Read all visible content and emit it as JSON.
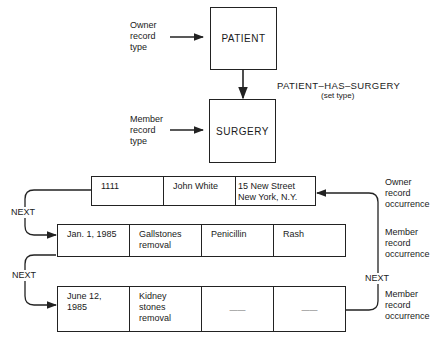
{
  "schema": {
    "owner_type_label": [
      "Owner",
      "record",
      "type"
    ],
    "member_type_label": [
      "Member",
      "record",
      "type"
    ],
    "owner_record_type": "PATIENT",
    "member_record_type": "SURGERY",
    "set_name": "PATIENT–HAS–SURGERY",
    "set_caption": "(set type)"
  },
  "occurrences": {
    "owner_label": [
      "Owner",
      "record",
      "occurrence"
    ],
    "member_label_1": [
      "Member",
      "record",
      "occurrence"
    ],
    "member_label_2": [
      "Member",
      "record",
      "occurrence"
    ],
    "next_label": "NEXT",
    "owner_record": [
      "1111",
      "John White",
      "15 New Street\nNew York, N.Y."
    ],
    "member_records": [
      [
        "Jan. 1, 1985",
        "Gallstones\nremoval",
        "Penicillin",
        "Rash"
      ],
      [
        "June 12,\n1985",
        "Kidney\nstones\nremoval",
        "——",
        "——"
      ]
    ]
  }
}
